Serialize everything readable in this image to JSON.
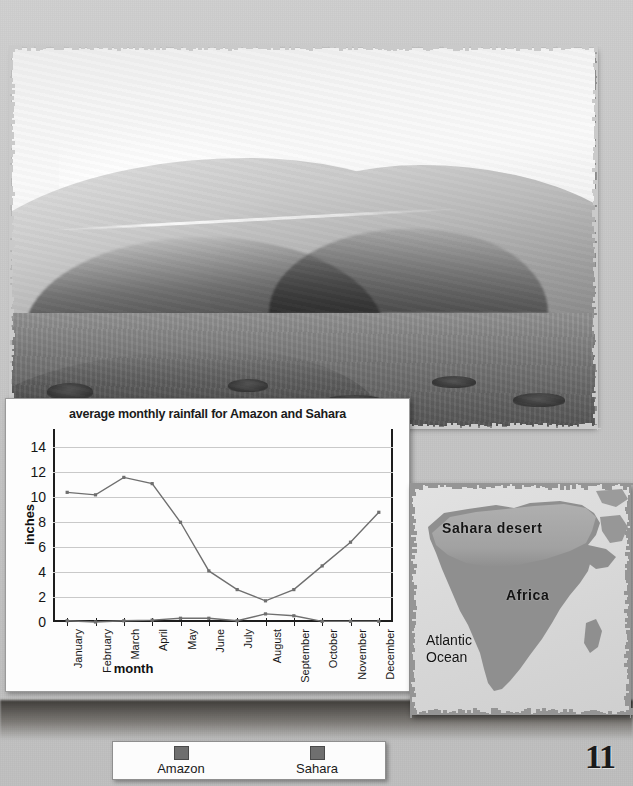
{
  "page": {
    "number": "11",
    "background_color": "#c6c6c6"
  },
  "photo": {
    "name": "sand-dunes-photograph",
    "alt": "Black and white photograph of Sahara sand dunes"
  },
  "chart_panel": {
    "title": "average monthly rainfall for Amazon and Sahara",
    "ylabel": "inches",
    "xlabel": "month"
  },
  "legend": {
    "items": [
      {
        "label": "Amazon",
        "color": "#6f6f6f"
      },
      {
        "label": "Sahara",
        "color": "#6f6f6f"
      }
    ]
  },
  "map": {
    "labels": {
      "sahara": "Sahara desert",
      "africa": "Africa",
      "atlantic": "Atlantic\nOcean"
    },
    "land_color": "#8f8f8f",
    "desert_color": "#a5a5a5",
    "ocean_color": "#dadada"
  },
  "chart_data": {
    "type": "line",
    "title": "average monthly rainfall for Amazon and Sahara",
    "xlabel": "month",
    "ylabel": "inches",
    "categories": [
      "January",
      "February",
      "March",
      "April",
      "May",
      "June",
      "July",
      "August",
      "September",
      "October",
      "November",
      "December"
    ],
    "yticks": [
      0,
      2,
      4,
      6,
      8,
      10,
      12,
      14
    ],
    "ylim": [
      0,
      15
    ],
    "grid": true,
    "legend_position": "below-figure",
    "series": [
      {
        "name": "Amazon",
        "color": "#6f6f6f",
        "values": [
          10.4,
          10.2,
          11.6,
          11.1,
          8.0,
          4.1,
          2.6,
          1.7,
          2.6,
          4.5,
          6.4,
          8.8
        ]
      },
      {
        "name": "Sahara",
        "color": "#6f6f6f",
        "values": [
          0.1,
          0.0,
          0.1,
          0.15,
          0.3,
          0.3,
          0.1,
          0.65,
          0.5,
          0.05,
          0.05,
          0.05
        ]
      }
    ]
  }
}
